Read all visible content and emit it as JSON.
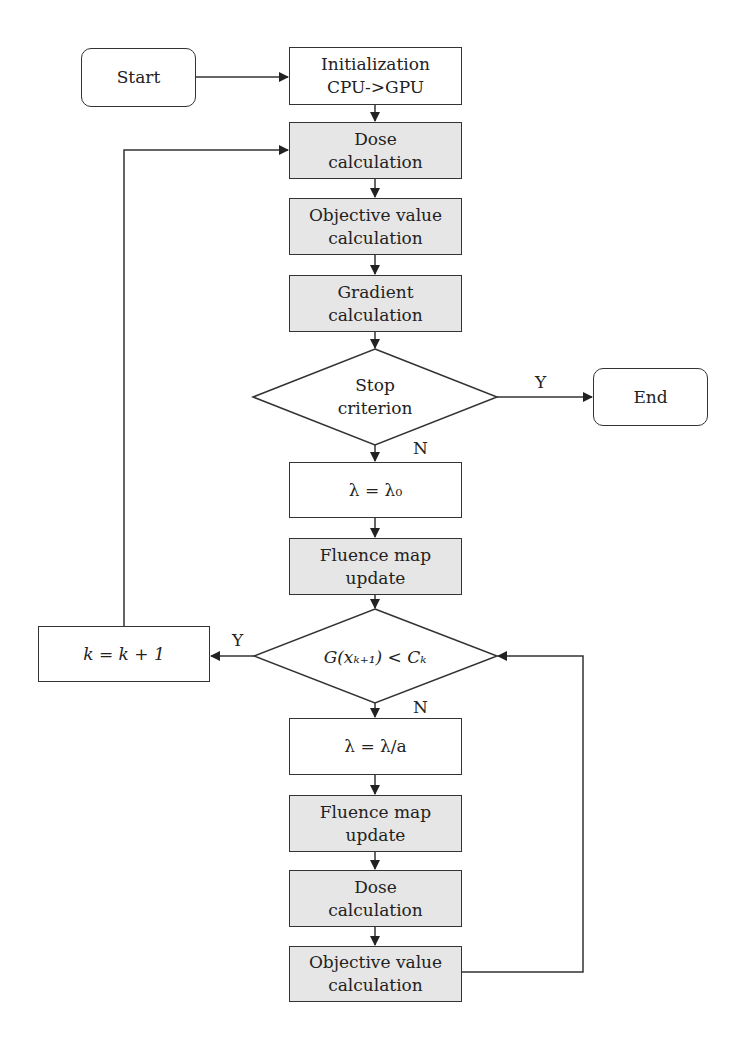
{
  "nodes": {
    "start": "Start",
    "init": "Initialization\nCPU->GPU",
    "dose1": "Dose\ncalculation",
    "objective1": "Objective value\ncalculation",
    "gradient": "Gradient\ncalculation",
    "stop": "Stop\ncriterion",
    "end": "End",
    "lambda0": "λ = λ₀",
    "fluence1": "Fluence map\nupdate",
    "condition": "G(xₖ₊₁) < Cₖ",
    "kinc": "k = k + 1",
    "lambda_div": "λ = λ/a",
    "fluence2": "Fluence map\nupdate",
    "dose2": "Dose\ncalculation",
    "objective2": "Objective value\ncalculation"
  },
  "edge_labels": {
    "stop_yes": "Y",
    "stop_no": "N",
    "cond_yes": "Y",
    "cond_no": "N"
  },
  "colors": {
    "process_fill": "#e6e6e6",
    "plain_fill": "#ffffff",
    "stroke": "#333333"
  }
}
